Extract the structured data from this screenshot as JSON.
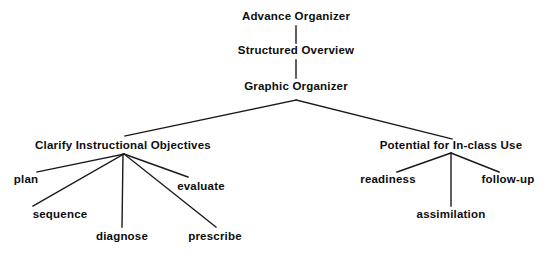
{
  "diagram": {
    "type": "hierarchy-tree",
    "background_color": "#ffffff",
    "text_color": "#0d0d0d",
    "line_color": "#1a1a1a",
    "nodes": [
      {
        "id": "advance-organizer",
        "label": "Advance Organizer",
        "level": 1,
        "x": 296,
        "y": 17
      },
      {
        "id": "structured-overview",
        "label": "Structured Overview",
        "level": 2,
        "x": 296,
        "y": 51
      },
      {
        "id": "graphic-organizer",
        "label": "Graphic Organizer",
        "level": 3,
        "x": 296,
        "y": 87
      },
      {
        "id": "clarify-objectives",
        "label": "Clarify Instructional Objectives",
        "level": 4,
        "x": 123,
        "y": 146
      },
      {
        "id": "in-class-use",
        "label": "Potential for In-class Use",
        "level": 4,
        "x": 451,
        "y": 146
      },
      {
        "id": "plan",
        "label": "plan",
        "level": 5,
        "x": 26,
        "y": 180
      },
      {
        "id": "sequence",
        "label": "sequence",
        "level": 5,
        "x": 60,
        "y": 215
      },
      {
        "id": "diagnose",
        "label": "diagnose",
        "level": 5,
        "x": 122,
        "y": 237
      },
      {
        "id": "prescribe",
        "label": "prescribe",
        "level": 5,
        "x": 215,
        "y": 237
      },
      {
        "id": "evaluate",
        "label": "evaluate",
        "level": 5,
        "x": 201,
        "y": 187
      },
      {
        "id": "readiness",
        "label": "readiness",
        "level": 5,
        "x": 388,
        "y": 180
      },
      {
        "id": "assimilation",
        "label": "assimilation",
        "level": 5,
        "x": 451,
        "y": 215
      },
      {
        "id": "follow-up",
        "label": "follow-up",
        "level": 5,
        "x": 508,
        "y": 180
      }
    ],
    "edges": [
      {
        "from": "advance-organizer",
        "to": "structured-overview",
        "x1": 296,
        "y1": 26,
        "x2": 296,
        "y2": 43
      },
      {
        "from": "structured-overview",
        "to": "graphic-organizer",
        "x1": 296,
        "y1": 60,
        "x2": 296,
        "y2": 78
      },
      {
        "from": "graphic-organizer",
        "to": "clarify-objectives",
        "x1": 296,
        "y1": 100,
        "x2": 125,
        "y2": 136
      },
      {
        "from": "graphic-organizer",
        "to": "in-class-use",
        "x1": 296,
        "y1": 100,
        "x2": 452,
        "y2": 139
      },
      {
        "from": "clarify-objectives",
        "to": "plan",
        "x1": 124,
        "y1": 154,
        "x2": 37,
        "y2": 172
      },
      {
        "from": "clarify-objectives",
        "to": "sequence",
        "x1": 124,
        "y1": 154,
        "x2": 33,
        "y2": 206
      },
      {
        "from": "clarify-objectives",
        "to": "diagnose",
        "x1": 123,
        "y1": 154,
        "x2": 122,
        "y2": 227
      },
      {
        "from": "clarify-objectives",
        "to": "evaluate",
        "x1": 124,
        "y1": 154,
        "x2": 188,
        "y2": 177
      },
      {
        "from": "clarify-objectives",
        "to": "prescribe",
        "x1": 124,
        "y1": 154,
        "x2": 216,
        "y2": 227
      },
      {
        "from": "in-class-use",
        "to": "readiness",
        "x1": 451,
        "y1": 153,
        "x2": 397,
        "y2": 172
      },
      {
        "from": "in-class-use",
        "to": "assimilation",
        "x1": 451,
        "y1": 153,
        "x2": 451,
        "y2": 206
      },
      {
        "from": "in-class-use",
        "to": "follow-up",
        "x1": 451,
        "y1": 153,
        "x2": 499,
        "y2": 172
      }
    ]
  }
}
